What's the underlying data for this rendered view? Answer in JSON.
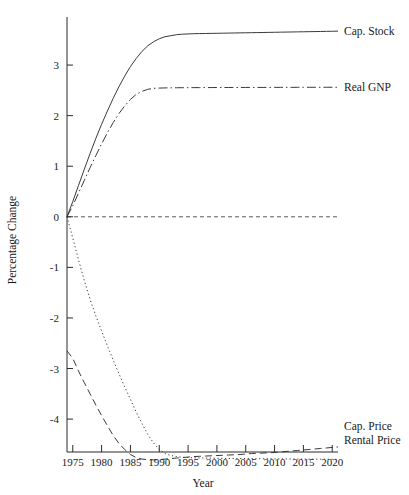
{
  "chart_data": {
    "type": "line",
    "title": "",
    "xlabel": "Year",
    "ylabel": "Percentage Change",
    "xlim": [
      1974,
      2021
    ],
    "ylim": [
      -4.65,
      3.95
    ],
    "grid": false,
    "legend_position": "right-of-line-ends",
    "xticks": [
      1975,
      1980,
      1985,
      1990,
      1995,
      2000,
      2005,
      2010,
      2015,
      2020
    ],
    "xtick_labels": [
      "1975",
      "1980",
      "1985",
      "1990",
      "1995",
      "2000",
      "2005",
      "2010",
      "2015",
      "2020"
    ],
    "yticks": [
      3,
      2,
      1,
      0,
      -1,
      -2,
      -3,
      -4
    ],
    "ytick_labels": [
      "3",
      "2",
      "1",
      "0",
      "-1",
      "-2",
      "-3",
      "-4"
    ],
    "zero_reference_line": {
      "value": 0,
      "style": "dashed"
    },
    "x": [
      1974,
      1975,
      1976,
      1977,
      1978,
      1979,
      1980,
      1981,
      1982,
      1983,
      1984,
      1985,
      1986,
      1987,
      1988,
      1989,
      1990,
      1991,
      1992,
      1993,
      1994,
      1995,
      1996,
      1997,
      1998,
      1999,
      2000,
      2001,
      2002,
      2003,
      2004,
      2005,
      2006,
      2007,
      2008,
      2009,
      2010,
      2011,
      2012,
      2013,
      2014,
      2015,
      2016,
      2017,
      2018,
      2019,
      2020,
      2021
    ],
    "series": [
      {
        "name": "Cap. Stock",
        "label": "Cap. Stock",
        "style": "solid",
        "values": [
          0.0,
          0.3,
          0.62,
          0.94,
          1.25,
          1.55,
          1.83,
          2.09,
          2.34,
          2.57,
          2.78,
          2.97,
          3.13,
          3.27,
          3.38,
          3.46,
          3.52,
          3.56,
          3.58,
          3.6,
          3.61,
          3.615,
          3.62,
          3.622,
          3.624,
          3.626,
          3.628,
          3.63,
          3.632,
          3.634,
          3.636,
          3.638,
          3.64,
          3.642,
          3.644,
          3.646,
          3.648,
          3.65,
          3.652,
          3.654,
          3.656,
          3.658,
          3.66,
          3.662,
          3.664,
          3.666,
          3.668,
          3.67
        ]
      },
      {
        "name": "Real GNP",
        "label": "Real GNP",
        "style": "dash-dot",
        "values": [
          0.0,
          0.22,
          0.47,
          0.72,
          0.97,
          1.21,
          1.44,
          1.66,
          1.86,
          2.04,
          2.19,
          2.32,
          2.42,
          2.48,
          2.52,
          2.54,
          2.545,
          2.548,
          2.55,
          2.551,
          2.552,
          2.553,
          2.554,
          2.554,
          2.555,
          2.555,
          2.556,
          2.556,
          2.556,
          2.557,
          2.557,
          2.557,
          2.558,
          2.558,
          2.558,
          2.558,
          2.559,
          2.559,
          2.559,
          2.559,
          2.56,
          2.56,
          2.56,
          2.56,
          2.56,
          2.561,
          2.561,
          2.561
        ]
      },
      {
        "name": "Cap. Price",
        "label": "Cap. Price",
        "style": "dotted",
        "values": [
          0.0,
          -0.42,
          -0.85,
          -1.26,
          -1.63,
          -1.96,
          -2.26,
          -2.55,
          -2.83,
          -3.1,
          -3.36,
          -3.61,
          -3.86,
          -4.09,
          -4.3,
          -4.47,
          -4.6,
          -4.68,
          -4.72,
          -4.74,
          -4.755,
          -4.76,
          -4.765,
          -4.768,
          -4.77,
          -4.772,
          -4.774,
          -4.776,
          -4.777,
          -4.778,
          -4.779,
          -4.78,
          -4.781,
          -4.782,
          -4.783,
          -4.784,
          -4.785,
          -4.786,
          -4.787,
          -4.788,
          -4.789,
          -4.79,
          -4.79,
          -4.791,
          -4.792,
          -4.793,
          -4.794,
          -4.795
        ]
      },
      {
        "name": "Rental Price",
        "label": "Rental Price",
        "style": "long-dash",
        "values": [
          -2.65,
          -2.8,
          -3.05,
          -3.28,
          -3.5,
          -3.72,
          -3.93,
          -4.13,
          -4.32,
          -4.48,
          -4.6,
          -4.7,
          -4.76,
          -4.79,
          -4.8,
          -4.805,
          -4.8,
          -4.79,
          -4.78,
          -4.77,
          -4.76,
          -4.75,
          -4.74,
          -4.735,
          -4.73,
          -4.725,
          -4.72,
          -4.715,
          -4.71,
          -4.705,
          -4.7,
          -4.69,
          -4.68,
          -4.675,
          -4.67,
          -4.665,
          -4.66,
          -4.65,
          -4.64,
          -4.63,
          -4.62,
          -4.61,
          -4.6,
          -4.59,
          -4.58,
          -4.57,
          -4.56,
          -4.55
        ]
      }
    ],
    "annotations": [
      {
        "text": "Cap. Stock",
        "anchor_series": "Cap. Stock"
      },
      {
        "text": "Real GNP",
        "anchor_series": "Real GNP"
      },
      {
        "text": "Cap. Price",
        "anchor_series": "Cap. Price"
      },
      {
        "text": "Rental Price",
        "anchor_series": "Rental Price"
      }
    ]
  },
  "labels": {
    "x_axis_title": "Year",
    "y_axis_title": "Percentage Change"
  }
}
